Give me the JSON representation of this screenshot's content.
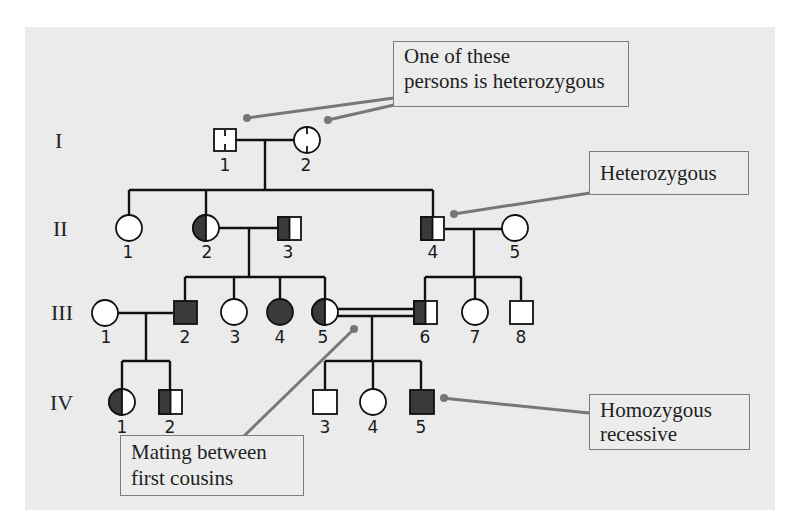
{
  "generations": [
    "I",
    "II",
    "III",
    "IV"
  ],
  "callouts": {
    "heterozygous_one": "One of these",
    "heterozygous_two": "persons is heterozygous",
    "heterozygous": "Heterozygous",
    "homozygous_one": "Homozygous",
    "homozygous_two": "recessive",
    "mating_one": "Mating between",
    "mating_two": "first cousins"
  },
  "individuals": {
    "I": [
      {
        "id": "1",
        "sex": "male",
        "status": "possible-carrier"
      },
      {
        "id": "2",
        "sex": "female",
        "status": "possible-carrier"
      }
    ],
    "II": [
      {
        "id": "1",
        "sex": "female",
        "status": "unaffected"
      },
      {
        "id": "2",
        "sex": "female",
        "status": "carrier"
      },
      {
        "id": "3",
        "sex": "male",
        "status": "carrier"
      },
      {
        "id": "4",
        "sex": "male",
        "status": "carrier"
      },
      {
        "id": "5",
        "sex": "female",
        "status": "unaffected"
      }
    ],
    "III": [
      {
        "id": "1",
        "sex": "female",
        "status": "unaffected"
      },
      {
        "id": "2",
        "sex": "male",
        "status": "affected"
      },
      {
        "id": "3",
        "sex": "female",
        "status": "unaffected"
      },
      {
        "id": "4",
        "sex": "female",
        "status": "affected"
      },
      {
        "id": "5",
        "sex": "female",
        "status": "carrier"
      },
      {
        "id": "6",
        "sex": "male",
        "status": "carrier"
      },
      {
        "id": "7",
        "sex": "female",
        "status": "unaffected"
      },
      {
        "id": "8",
        "sex": "male",
        "status": "unaffected"
      }
    ],
    "IV": [
      {
        "id": "1",
        "sex": "female",
        "status": "carrier"
      },
      {
        "id": "2",
        "sex": "male",
        "status": "carrier"
      },
      {
        "id": "3",
        "sex": "male",
        "status": "unaffected"
      },
      {
        "id": "4",
        "sex": "female",
        "status": "unaffected"
      },
      {
        "id": "5",
        "sex": "male",
        "status": "affected"
      }
    ]
  },
  "colors": {
    "background": "#ebebeb",
    "affected": "#3a3a3a",
    "line": "#111111",
    "callout_line": "#777777"
  }
}
